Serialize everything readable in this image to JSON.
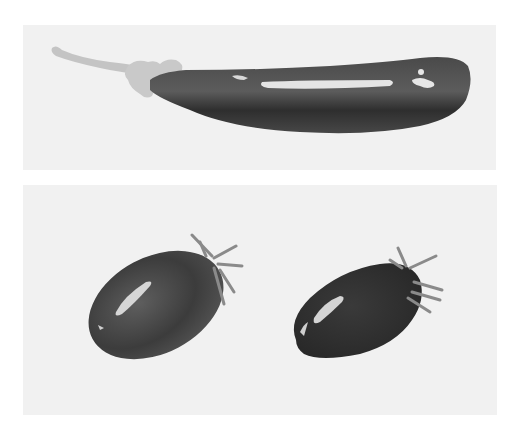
{
  "image": {
    "description": "Grayscale watercolor illustration of vegetables on two light panels",
    "style": "watercolor, grayscale",
    "panels": [
      {
        "id": "top",
        "subject": "eggplant",
        "count": 1
      },
      {
        "id": "bottom",
        "subject": "cherry-tomato",
        "count": 2
      }
    ]
  },
  "colors": {
    "page_background": "#ffffff",
    "panel_background": "#f1f1f1",
    "stem_light": "#c4c4c4",
    "body_dark": "#3a3a3a",
    "body_mid": "#555555",
    "highlight": "#e8e8e8"
  }
}
